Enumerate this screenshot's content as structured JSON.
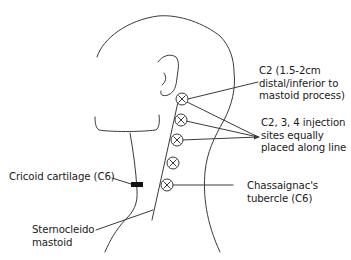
{
  "diagram": {
    "colors": {
      "stroke": "#3a3a3a",
      "text": "#1a1a1a",
      "marker_fill": "#111111",
      "background": "#ffffff"
    },
    "injection_sites": [
      {
        "id": "site-1",
        "icon": "x-circle-icon",
        "cx": 182,
        "cy": 99
      },
      {
        "id": "site-2",
        "icon": "x-circle-icon",
        "cx": 181,
        "cy": 120
      },
      {
        "id": "site-3",
        "icon": "x-circle-icon",
        "cx": 177,
        "cy": 140
      },
      {
        "id": "site-4",
        "icon": "x-circle-icon",
        "cx": 173,
        "cy": 163
      },
      {
        "id": "site-5",
        "icon": "x-circle-icon",
        "cx": 167,
        "cy": 185
      }
    ],
    "labels": {
      "c2": {
        "lines": [
          "C2 (1.5-2cm",
          "distal/inferior to",
          "mastoid process)"
        ]
      },
      "c234": {
        "lines": [
          "C2, 3, 4 injection",
          "sites equally",
          "placed along line"
        ]
      },
      "chassaignac": {
        "lines": [
          "Chassaignac's",
          "tubercle (C6)"
        ]
      },
      "cricoid": {
        "lines": [
          "Cricoid cartilage (C6)"
        ]
      },
      "scm": {
        "lines": [
          "Sternocleido",
          "mastoid"
        ]
      }
    }
  }
}
